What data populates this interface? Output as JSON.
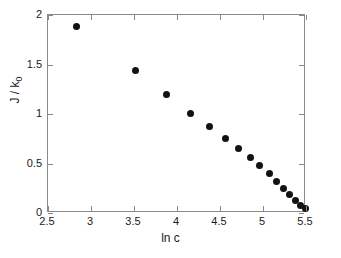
{
  "chart_data": {
    "type": "scatter",
    "title": "",
    "xlabel": "ln c",
    "ylabel": "J / k0",
    "ylabel_base": "J / k",
    "ylabel_sub": "0",
    "xlim": [
      2.5,
      5.5
    ],
    "ylim": [
      0,
      2
    ],
    "xticks": [
      2.5,
      3,
      3.5,
      4,
      4.5,
      5,
      5.5
    ],
    "xticklabels": [
      "2.5",
      "3",
      "3.5",
      "4",
      "4.5",
      "5",
      "5.5"
    ],
    "yticks": [
      0,
      0.5,
      1,
      1.5,
      2
    ],
    "yticklabels": [
      "0",
      "0.5",
      "1",
      "1.5",
      "2"
    ],
    "grid": false,
    "legend": null,
    "marker": "filled-circle",
    "marker_color": "#121212",
    "axis_color": "#8a8a8a",
    "background": "#ffffff",
    "x": [
      2.83,
      3.52,
      3.88,
      4.16,
      4.38,
      4.56,
      4.71,
      4.85,
      4.96,
      5.07,
      5.16,
      5.24,
      5.31,
      5.38,
      5.44,
      5.49
    ],
    "y": [
      1.88,
      1.44,
      1.2,
      1.01,
      0.87,
      0.75,
      0.65,
      0.56,
      0.48,
      0.4,
      0.32,
      0.25,
      0.19,
      0.13,
      0.08,
      0.05
    ],
    "series": [
      {
        "name": "J/k0 vs ln c",
        "points": [
          {
            "x": 2.83,
            "y": 1.88
          },
          {
            "x": 3.52,
            "y": 1.44
          },
          {
            "x": 3.88,
            "y": 1.2
          },
          {
            "x": 4.16,
            "y": 1.01
          },
          {
            "x": 4.38,
            "y": 0.87
          },
          {
            "x": 4.56,
            "y": 0.75
          },
          {
            "x": 4.71,
            "y": 0.65
          },
          {
            "x": 4.85,
            "y": 0.56
          },
          {
            "x": 4.96,
            "y": 0.48
          },
          {
            "x": 5.07,
            "y": 0.4
          },
          {
            "x": 5.16,
            "y": 0.32
          },
          {
            "x": 5.24,
            "y": 0.25
          },
          {
            "x": 5.31,
            "y": 0.19
          },
          {
            "x": 5.38,
            "y": 0.13
          },
          {
            "x": 5.44,
            "y": 0.08
          },
          {
            "x": 5.49,
            "y": 0.05
          }
        ]
      }
    ]
  }
}
